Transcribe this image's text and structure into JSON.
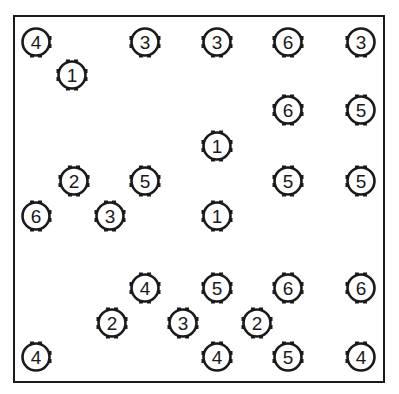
{
  "puzzle": {
    "type": "gear-number-puzzle",
    "colors": {
      "ink": "#1a1a1a",
      "background": "#ffffff"
    },
    "gears": [
      {
        "x": 36,
        "y": 42,
        "value": "4",
        "teeth": [
          "right-top",
          "right-bottom",
          "bottom-left",
          "bottom-right"
        ]
      },
      {
        "x": 145,
        "y": 42,
        "value": "3",
        "teeth": [
          "left-top",
          "left-bottom",
          "right-top",
          "right-bottom",
          "bottom-left",
          "bottom-right"
        ]
      },
      {
        "x": 217,
        "y": 42,
        "value": "3",
        "teeth": [
          "left-top",
          "left-bottom",
          "right-top",
          "right-bottom",
          "bottom-left",
          "bottom-right"
        ]
      },
      {
        "x": 288,
        "y": 42,
        "value": "6",
        "teeth": [
          "left-top",
          "left-bottom",
          "right-top",
          "right-bottom",
          "bottom-left",
          "bottom-right"
        ]
      },
      {
        "x": 361,
        "y": 42,
        "value": "3",
        "teeth": [
          "left-top",
          "left-bottom",
          "bottom-left",
          "bottom-right"
        ]
      },
      {
        "x": 72,
        "y": 75,
        "value": "1",
        "teeth": [
          "top-left",
          "top-right",
          "left-top",
          "left-bottom",
          "right-top",
          "right-bottom",
          "bottom-left",
          "bottom-right"
        ]
      },
      {
        "x": 288,
        "y": 110,
        "value": "6",
        "teeth": [
          "top-left",
          "top-right",
          "left-top",
          "left-bottom",
          "right-top",
          "right-bottom",
          "bottom-left",
          "bottom-right"
        ]
      },
      {
        "x": 361,
        "y": 110,
        "value": "5",
        "teeth": [
          "top-left",
          "top-right",
          "left-top",
          "left-bottom",
          "bottom-left",
          "bottom-right"
        ]
      },
      {
        "x": 217,
        "y": 146,
        "value": "1",
        "teeth": [
          "top-left",
          "top-right",
          "left-top",
          "left-bottom",
          "right-top",
          "right-bottom",
          "bottom-left",
          "bottom-right"
        ]
      },
      {
        "x": 74,
        "y": 181,
        "value": "2",
        "teeth": [
          "top-left",
          "top-right",
          "left-top",
          "left-bottom",
          "right-top",
          "right-bottom",
          "bottom-left",
          "bottom-right"
        ]
      },
      {
        "x": 145,
        "y": 181,
        "value": "5",
        "teeth": [
          "top-left",
          "top-right",
          "left-top",
          "left-bottom",
          "right-top",
          "right-bottom",
          "bottom-left",
          "bottom-right"
        ]
      },
      {
        "x": 288,
        "y": 181,
        "value": "5",
        "teeth": [
          "top-left",
          "top-right",
          "left-top",
          "left-bottom",
          "right-top",
          "right-bottom",
          "bottom-left",
          "bottom-right"
        ]
      },
      {
        "x": 361,
        "y": 181,
        "value": "5",
        "teeth": [
          "top-left",
          "top-right",
          "left-top",
          "left-bottom",
          "bottom-left",
          "bottom-right"
        ]
      },
      {
        "x": 36,
        "y": 216,
        "value": "6",
        "teeth": [
          "top-left",
          "top-right",
          "right-top",
          "right-bottom",
          "bottom-left",
          "bottom-right"
        ]
      },
      {
        "x": 110,
        "y": 216,
        "value": "3",
        "teeth": [
          "top-left",
          "top-right",
          "left-top",
          "left-bottom",
          "right-top",
          "right-bottom",
          "bottom-left",
          "bottom-right"
        ]
      },
      {
        "x": 217,
        "y": 216,
        "value": "1",
        "teeth": [
          "top-left",
          "top-right",
          "left-top",
          "left-bottom",
          "right-top",
          "right-bottom",
          "bottom-left",
          "bottom-right"
        ]
      },
      {
        "x": 145,
        "y": 288,
        "value": "4",
        "teeth": [
          "top-left",
          "top-right",
          "left-top",
          "left-bottom",
          "right-top",
          "right-bottom",
          "bottom-left",
          "bottom-right"
        ]
      },
      {
        "x": 217,
        "y": 288,
        "value": "5",
        "teeth": [
          "top-left",
          "top-right",
          "left-top",
          "left-bottom",
          "right-top",
          "right-bottom",
          "bottom-left",
          "bottom-right"
        ]
      },
      {
        "x": 288,
        "y": 288,
        "value": "6",
        "teeth": [
          "top-left",
          "top-right",
          "left-top",
          "left-bottom",
          "right-top",
          "right-bottom",
          "bottom-left",
          "bottom-right"
        ]
      },
      {
        "x": 361,
        "y": 288,
        "value": "6",
        "teeth": [
          "top-left",
          "top-right",
          "left-top",
          "left-bottom",
          "bottom-left",
          "bottom-right"
        ]
      },
      {
        "x": 112,
        "y": 323,
        "value": "2",
        "teeth": [
          "top-left",
          "top-right",
          "left-top",
          "left-bottom",
          "right-top",
          "right-bottom",
          "bottom-left",
          "bottom-right"
        ]
      },
      {
        "x": 183,
        "y": 323,
        "value": "3",
        "teeth": [
          "top-left",
          "top-right",
          "left-top",
          "left-bottom",
          "right-top",
          "right-bottom",
          "bottom-left",
          "bottom-right"
        ]
      },
      {
        "x": 257,
        "y": 323,
        "value": "2",
        "teeth": [
          "top-left",
          "top-right",
          "left-top",
          "left-bottom",
          "right-top",
          "right-bottom",
          "bottom-left",
          "bottom-right"
        ]
      },
      {
        "x": 36,
        "y": 357,
        "value": "4",
        "teeth": [
          "top-left",
          "top-right",
          "right-top",
          "right-bottom"
        ]
      },
      {
        "x": 217,
        "y": 357,
        "value": "4",
        "teeth": [
          "top-left",
          "top-right",
          "left-top",
          "left-bottom",
          "right-top",
          "right-bottom"
        ]
      },
      {
        "x": 288,
        "y": 357,
        "value": "5",
        "teeth": [
          "top-left",
          "top-right",
          "left-top",
          "left-bottom",
          "right-top",
          "right-bottom"
        ]
      },
      {
        "x": 361,
        "y": 357,
        "value": "4",
        "teeth": [
          "top-left",
          "top-right",
          "left-top",
          "left-bottom"
        ]
      }
    ]
  }
}
